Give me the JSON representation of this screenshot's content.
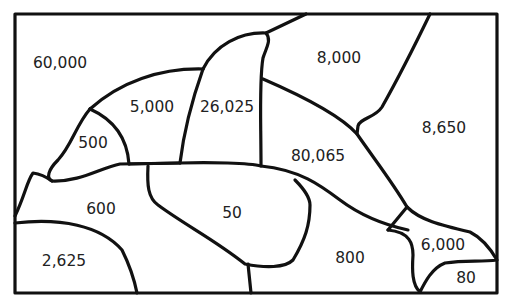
{
  "diagram": {
    "type": "region-map",
    "regions": [
      {
        "id": "top-left-sky",
        "label": "60,000",
        "x": 60,
        "y": 63
      },
      {
        "id": "head-upper",
        "label": "5,000",
        "x": 152,
        "y": 107
      },
      {
        "id": "dorsal-fin",
        "label": "26,025",
        "x": 227,
        "y": 107
      },
      {
        "id": "top-middle-sky",
        "label": "8,000",
        "x": 339,
        "y": 58
      },
      {
        "id": "right-sky",
        "label": "8,650",
        "x": 444,
        "y": 128
      },
      {
        "id": "snout",
        "label": "500",
        "x": 93,
        "y": 143
      },
      {
        "id": "body",
        "label": "80,065",
        "x": 318,
        "y": 156
      },
      {
        "id": "flipper-left-water",
        "label": "600",
        "x": 101,
        "y": 209
      },
      {
        "id": "belly-flipper",
        "label": "50",
        "x": 232,
        "y": 213
      },
      {
        "id": "rock",
        "label": "2,625",
        "x": 64,
        "y": 261
      },
      {
        "id": "bottom-water",
        "label": "800",
        "x": 350,
        "y": 258
      },
      {
        "id": "tail",
        "label": "6,000",
        "x": 443,
        "y": 245
      },
      {
        "id": "bottom-right-corner",
        "label": "80",
        "x": 466,
        "y": 278
      }
    ],
    "colors": {
      "stroke": "#111111",
      "text": "#222222",
      "background": "#ffffff"
    }
  }
}
